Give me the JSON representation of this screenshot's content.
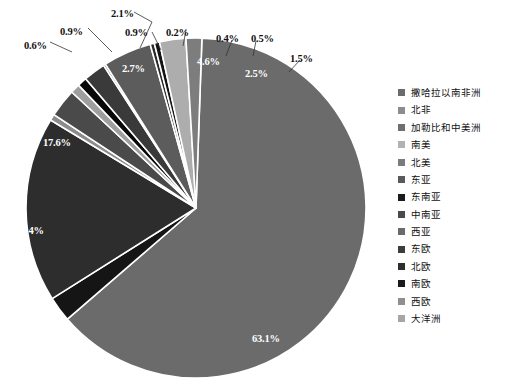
{
  "chart_data": {
    "type": "pie",
    "title": "",
    "subtitle": "",
    "xlabel": "",
    "ylabel": "",
    "legend_position": "right",
    "grid": false,
    "unit": "%",
    "categories": [
      "撒哈拉以南非洲",
      "北非",
      "加勒比和中美洲",
      "南美",
      "北美",
      "东亚",
      "东南亚",
      "中南亚",
      "西亚",
      "东欧",
      "北欧",
      "南欧",
      "西欧",
      "大洋洲"
    ],
    "values": [
      63.1,
      2.4,
      17.6,
      0.6,
      2.7,
      0.9,
      0.9,
      2.1,
      0.2,
      4.6,
      0.4,
      0.5,
      2.5,
      1.5
    ],
    "labels": [
      "63.1%",
      "2.4%",
      "17.6%",
      "0.6%",
      "2.7%",
      "0.9%",
      "0.9%",
      "2.1%",
      "0.2%",
      "4.6%",
      "0.4%",
      "0.5%",
      "2.5%",
      "1.5%"
    ],
    "colors": [
      "#6b6b6b",
      "#151515",
      "#2d2d2d",
      "#8c8c8c",
      "#4a4a4a",
      "#9e9e9e",
      "#080808",
      "#3a3a3a",
      "#6f6f6f",
      "#5c5c5c",
      "#2a2a2a",
      "#141414",
      "#adadad",
      "#7d7d7d"
    ]
  },
  "legend": {
    "items": [
      {
        "label": "撒哈拉以南非洲",
        "color": "#6b6b6b"
      },
      {
        "label": "北非",
        "color": "#8d8d8d"
      },
      {
        "label": "加勒比和中美洲",
        "color": "#6f6f6f"
      },
      {
        "label": "南美",
        "color": "#b2b2b2"
      },
      {
        "label": "北美",
        "color": "#7b7b7b"
      },
      {
        "label": "东亚",
        "color": "#5a5a5a"
      },
      {
        "label": "东南亚",
        "color": "#1b1b1b"
      },
      {
        "label": "中南亚",
        "color": "#4a4a4a"
      },
      {
        "label": "西亚",
        "color": "#6a6a6a"
      },
      {
        "label": "东欧",
        "color": "#3c3c3c"
      },
      {
        "label": "北欧",
        "color": "#2e2e2e"
      },
      {
        "label": "南欧",
        "color": "#1a1a1a"
      },
      {
        "label": "西欧",
        "color": "#8f8f8f"
      },
      {
        "label": "大洋洲",
        "color": "#a6a6a6"
      }
    ]
  },
  "caption": {
    "text": ""
  },
  "geometry": {
    "cx": 196,
    "cy": 208,
    "r": 170,
    "start_angle_deg": -88,
    "direction": "clockwise"
  },
  "callouts": [
    {
      "text": "0.6%",
      "x": 24,
      "y": 40
    },
    {
      "text": "0.9%",
      "x": 60,
      "y": 26
    },
    {
      "text": "2.1%",
      "x": 111,
      "y": 8
    },
    {
      "text": "0.9%",
      "x": 125,
      "y": 27
    },
    {
      "text": "0.2%",
      "x": 166,
      "y": 27
    },
    {
      "text": "0.4%",
      "x": 216,
      "y": 33
    },
    {
      "text": "0.5%",
      "x": 251,
      "y": 33
    },
    {
      "text": "1.5%",
      "x": 290,
      "y": 53
    }
  ],
  "inner_labels": [
    {
      "text": "2.7%",
      "x": 122,
      "y": 63
    },
    {
      "text": "4.6%",
      "x": 197,
      "y": 56
    },
    {
      "text": "2.5%",
      "x": 245,
      "y": 68
    },
    {
      "text": "17.6%",
      "x": 43,
      "y": 137
    },
    {
      "text": "2.4%",
      "x": 21,
      "y": 225
    },
    {
      "text": "63.1%",
      "x": 252,
      "y": 333
    }
  ]
}
